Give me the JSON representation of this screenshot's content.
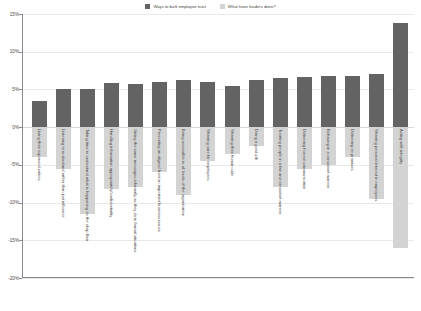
{
  "legend": {
    "items": [
      {
        "label": "Ways to built employee trust",
        "color": "#636363",
        "name": "legend-ways-to-build-trust"
      },
      {
        "label": "What have leaders done?",
        "color": "#d3d3d3",
        "name": "legend-what-have-leaders-done"
      }
    ]
  },
  "axis": {
    "y_ticks": [
      "15%",
      "10%",
      "5%",
      "0%",
      "-5%",
      "-10%",
      "-15%",
      "-20%"
    ]
  },
  "chart_data": {
    "type": "bar",
    "title": "",
    "subtitle": "",
    "xlabel": "",
    "ylabel": "",
    "ylim": [
      -20,
      15
    ],
    "ytick_step": 5,
    "grid": true,
    "legend_position": "top-center",
    "orientation": "vertical",
    "categories": [
      "Living their espoused values",
      "Listening to understand rather than just influence",
      "Taking time to understand what is happening on the shop floor",
      "Handling information appropriately/confidentiality",
      "Giving the same messages informally as they do in formal situations",
      "Presenting an aligned front on important business issues",
      "Being accessible to all levels of the organization",
      "Showing care for employees",
      "Showing their human side",
      "Doing a good job",
      "Treating people in a fair and consistent manner",
      "Delivering honest communication",
      "Behaving in a consistent manner",
      "Delivering on promises",
      "Showing personal interest in employees",
      "Acting with integrity"
    ],
    "series": [
      {
        "name": "Ways to built employee trust",
        "color": "#636363",
        "values": [
          3.5,
          5.0,
          5.0,
          5.8,
          5.7,
          6.0,
          6.2,
          6.0,
          5.5,
          6.3,
          6.5,
          6.7,
          6.8,
          6.8,
          7.0,
          13.8
        ]
      },
      {
        "name": "What have leaders done?",
        "color": "#d3d3d3",
        "values": [
          -4.0,
          -5.5,
          -11.5,
          -8.2,
          -8.0,
          -6.0,
          -9.0,
          -4.5,
          -3.5,
          -2.5,
          -8.0,
          -5.5,
          -5.0,
          -4.0,
          -9.5,
          -16.0
        ]
      }
    ]
  }
}
